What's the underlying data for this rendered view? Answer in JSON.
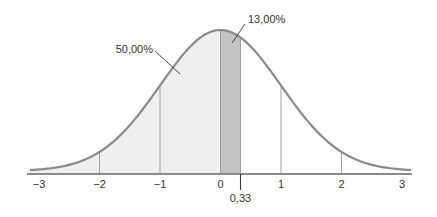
{
  "chart_data": {
    "type": "area",
    "title": "",
    "xlabel": "",
    "ylabel": "",
    "distribution": "standard normal",
    "xlim": [
      -3,
      3
    ],
    "x_ticks": [
      -3,
      -2,
      -1,
      0,
      1,
      2,
      3
    ],
    "x_tick_labels": [
      "−3",
      "−2",
      "−1",
      "0",
      "1",
      "2",
      "3"
    ],
    "marker": {
      "x": 0.33,
      "label": "0,33"
    },
    "shaded_regions": [
      {
        "from": -3,
        "to": 0,
        "label": "50,00%",
        "color": "#efefef"
      },
      {
        "from": 0,
        "to": 0.33,
        "label": "13,00%",
        "color": "#c4c4c4"
      }
    ],
    "vertical_guides": [
      -2,
      -1,
      0,
      1,
      2
    ],
    "grid": false,
    "legend": null
  },
  "colors": {
    "curve": "#8a8a8a",
    "axis": "#8a8a8a",
    "guide": "#a0a0a0",
    "text": "#333333"
  },
  "labels": {
    "left_area": "50,00%",
    "mid_area": "13,00%",
    "marker": "0,33"
  }
}
